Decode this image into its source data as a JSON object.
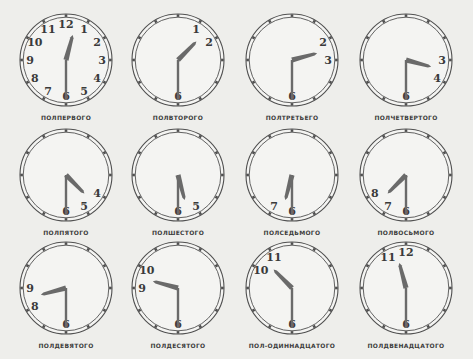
{
  "figure": {
    "background": "#eeeeeb",
    "ink_color": "#505050",
    "hand_color": "#6a6a6a",
    "radius": 46,
    "clocks": [
      {
        "label": "ПОЛПЕРВОГО",
        "time": "12:30",
        "cx": 66,
        "cy": 60,
        "numerals": [
          "12",
          "1",
          "2",
          "3",
          "4",
          "5",
          "6",
          "7",
          "8",
          "9",
          "10",
          "11"
        ]
      },
      {
        "label": "ПОЛВТОРОГО",
        "time": "1:30",
        "cx": 178,
        "cy": 60,
        "numerals": [
          "1",
          "2",
          "6"
        ]
      },
      {
        "label": "ПОЛТРЕТЬЕГО",
        "time": "2:30",
        "cx": 292,
        "cy": 60,
        "numerals": [
          "2",
          "3",
          "6"
        ]
      },
      {
        "label": "ПОЛЧЕТВЕРТОГО",
        "time": "3:30",
        "cx": 406,
        "cy": 60,
        "numerals": [
          "3",
          "4",
          "6"
        ]
      },
      {
        "label": "ПОЛПЯТОГО",
        "time": "4:30",
        "cx": 66,
        "cy": 175,
        "numerals": [
          "4",
          "5",
          "6"
        ]
      },
      {
        "label": "ПОЛШЕСТОГО",
        "time": "5:30",
        "cx": 178,
        "cy": 175,
        "numerals": [
          "5",
          "6"
        ]
      },
      {
        "label": "ПОЛСЕДЬМОГО",
        "time": "6:30",
        "cx": 292,
        "cy": 175,
        "numerals": [
          "6",
          "7"
        ]
      },
      {
        "label": "ПОЛВОСЬМОГО",
        "time": "7:30",
        "cx": 406,
        "cy": 175,
        "numerals": [
          "6",
          "7",
          "8"
        ]
      },
      {
        "label": "ПОЛДЕВЯТОГО",
        "time": "8:30",
        "cx": 66,
        "cy": 288,
        "numerals": [
          "6",
          "8",
          "9"
        ]
      },
      {
        "label": "ПОЛДЕСЯТОГО",
        "time": "9:30",
        "cx": 178,
        "cy": 288,
        "numerals": [
          "6",
          "9",
          "10"
        ]
      },
      {
        "label": "ПОЛ-ОДИННАДЦАТОГО",
        "time": "10:30",
        "cx": 292,
        "cy": 288,
        "numerals": [
          "6",
          "10",
          "11"
        ]
      },
      {
        "label": "ПОЛДВЕНАДЦАТОГО",
        "time": "11:30",
        "cx": 406,
        "cy": 288,
        "numerals": [
          "6",
          "11",
          "12"
        ]
      }
    ]
  }
}
